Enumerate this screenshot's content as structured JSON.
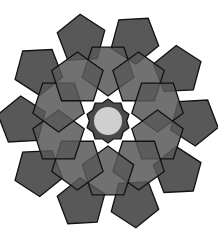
{
  "figure": {
    "center": [
      108,
      121
    ],
    "outer_ring": {
      "count": 10,
      "distance": 86,
      "radius": 25,
      "start_angle": -108
    },
    "inner_ring": {
      "count": 10,
      "distance": 52,
      "radius": 27,
      "start_angle": -90
    },
    "core": {
      "radius": 22,
      "points": 10
    },
    "hub": {
      "radius": 14
    },
    "colors": {
      "fill": "#585858",
      "stroke": "#111111",
      "hub": "#cfcfcf",
      "background": "#ffffff"
    }
  }
}
